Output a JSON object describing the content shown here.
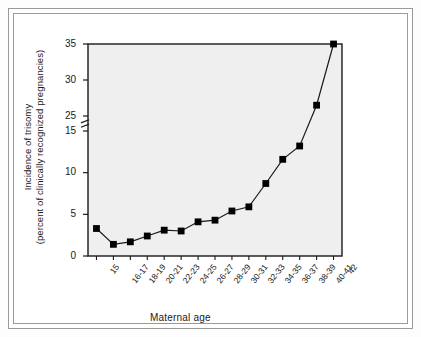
{
  "figure": {
    "background_color": "#ffffff",
    "plot_background_color": "#efefef",
    "frame_color": "#9a9a9a",
    "line_color": "#1a1a1a",
    "marker_color": "#000000"
  },
  "axis_break": {
    "present": true,
    "between": [
      15,
      25
    ],
    "symbol": "double-slash-break"
  },
  "chart_data": {
    "type": "line",
    "title": "",
    "subtitle": "",
    "xlabel": "Maternal age",
    "ylabel": "Incidence of trisomy (percent of clinically recognized pregnancies)",
    "ylabel_lines": [
      "Incidence of trisomy",
      "(percent of clinically recognized pregnancies)"
    ],
    "categories": [
      "15",
      "16-17",
      "18-19",
      "20-21",
      "22-23",
      "24-25",
      "26-27",
      "28-29",
      "30-31",
      "32-33",
      "34-35",
      "36-37",
      "38-39",
      "40-41",
      "42"
    ],
    "values": [
      3.3,
      1.4,
      1.7,
      2.4,
      3.1,
      3.0,
      4.1,
      4.3,
      5.4,
      5.9,
      8.7,
      11.6,
      13.2,
      26.5,
      35.0
    ],
    "series": [
      {
        "name": "Incidence of trisomy",
        "values": [
          3.3,
          1.4,
          1.7,
          2.4,
          3.1,
          3.0,
          4.1,
          4.3,
          5.4,
          5.9,
          8.7,
          11.6,
          13.2,
          26.5,
          35.0
        ],
        "marker": "filled-square",
        "marker_color": "#000000",
        "line_color": "#1a1a1a"
      }
    ],
    "ytick_labels": [
      "0",
      "5",
      "10",
      "15",
      "25",
      "30",
      "35"
    ],
    "ytick_values": [
      0,
      5,
      10,
      15,
      25,
      30,
      35
    ],
    "ylim": [
      0,
      35
    ],
    "grid": false,
    "legend": null,
    "legend_position": "none",
    "annotations": []
  }
}
